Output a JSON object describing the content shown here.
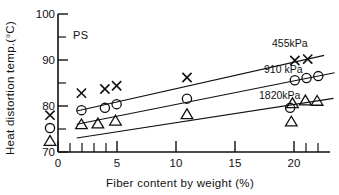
{
  "chart_data": {
    "type": "scatter",
    "title": "",
    "xlabel": "Fiber content by weight (%)",
    "ylabel": "Heat distortion temp.(°C)",
    "xlim": [
      0,
      23.2
    ],
    "ylim": [
      70,
      100
    ],
    "grid": false,
    "legend_position": "inline-right",
    "annotations": [
      {
        "text": "PS",
        "x": 2.0,
        "y": 95.2
      }
    ],
    "x_major_ticks": [
      0,
      5,
      10,
      15,
      20
    ],
    "x_major_tick_labels": [
      "0",
      "5",
      "10",
      "15",
      "20"
    ],
    "x_minor_ticks": [
      1,
      2,
      3,
      4,
      21,
      22,
      23
    ],
    "y_major_ticks": [
      70,
      80,
      90,
      100
    ],
    "y_major_tick_labels": [
      "70",
      "80",
      "90",
      "100"
    ],
    "y_minor_ticks": [
      75,
      85,
      95
    ],
    "series": [
      {
        "name": "455kPa",
        "marker": "x",
        "label_x": 20.6,
        "label_y": 93.3,
        "x": [
          0,
          2,
          4,
          5,
          11,
          20.2,
          21.3
        ],
        "y": [
          78.0,
          82.8,
          83.7,
          84.4,
          86.2,
          89.9,
          90.2
        ]
      },
      {
        "name": "910 kPa",
        "marker": "circle",
        "label_x": 19.6,
        "label_y": 88.1,
        "x": [
          0,
          2,
          4,
          5,
          11,
          20.2,
          21.2,
          22.2
        ],
        "y": [
          75.2,
          79.1,
          79.6,
          80.4,
          81.6,
          85.6,
          86.1,
          86.5
        ]
      },
      {
        "name": "1820kPa",
        "marker": "triangle",
        "label_x": 19.3,
        "label_y": 83.4,
        "x": [
          0,
          2,
          3.4,
          4.9,
          11,
          20.0,
          21.1,
          22.1
        ],
        "y": [
          72.4,
          76.0,
          76.2,
          76.8,
          78.2,
          80.6,
          81.2,
          81.1
        ]
      }
    ],
    "extra_markers": [
      {
        "series": "910 kPa",
        "marker": "circle",
        "x": 19.8,
        "y": 79.6
      },
      {
        "series": "1820kPa",
        "marker": "triangle",
        "x": 19.9,
        "y": 76.6
      }
    ]
  }
}
